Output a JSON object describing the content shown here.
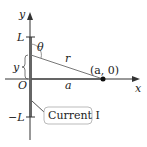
{
  "diagram": {
    "axes": {
      "x_label": "x",
      "y_label": "y",
      "origin_label": "O"
    },
    "ticks": {
      "top": "L",
      "bottom": "−L"
    },
    "labels": {
      "theta": "θ",
      "r": "r",
      "y_segment": "y",
      "a_segment": "a",
      "point": "(a, 0)"
    },
    "callout": {
      "text": "Current I"
    },
    "colors": {
      "line": "#555555",
      "wire": "#444444",
      "axis": "#333333",
      "callout_border": "#999999"
    }
  }
}
